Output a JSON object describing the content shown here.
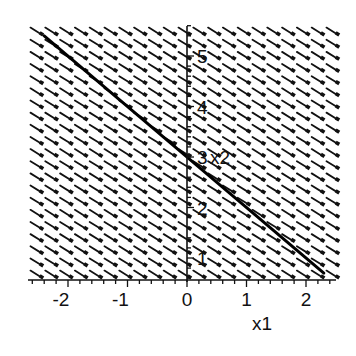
{
  "chart_data": {
    "type": "line",
    "subtype": "direction-field",
    "title": "",
    "xlabel": "x1",
    "ylabel": "x2",
    "xlim": [
      -2.6,
      2.5
    ],
    "ylim": [
      0.6,
      5.6
    ],
    "grid": false,
    "legend": null,
    "x_ticks": [
      -2,
      -1,
      0,
      1,
      2
    ],
    "x_tick_labels": [
      "-2",
      "-1",
      "0",
      "1",
      "2"
    ],
    "y_ticks": [
      1,
      2,
      3,
      4,
      5
    ],
    "y_tick_labels": [
      "1",
      "2",
      "3",
      "4",
      "5"
    ],
    "direction_field": {
      "columns": 21,
      "rows": 21,
      "arrow_slope": -0.5,
      "color": "#111111"
    },
    "series": [
      {
        "name": "solution curve",
        "equation": "x2 = 3 - x1",
        "x": [
          -2.4,
          2.3
        ],
        "y": [
          5.4,
          0.7
        ],
        "color": "#000000",
        "line_width": 3
      }
    ]
  }
}
